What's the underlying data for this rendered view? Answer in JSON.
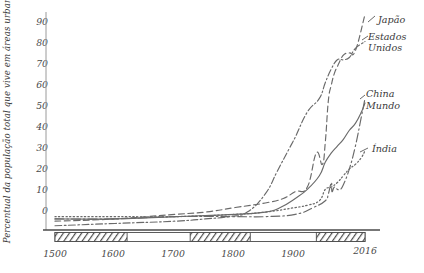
{
  "chart_data": {
    "type": "line",
    "title": "",
    "xlabel": "",
    "ylabel": "Percentual da população total que vive em áreas urbanas",
    "xlim": [
      1500,
      2016
    ],
    "ylim": [
      0,
      95
    ],
    "grid": false,
    "legend_position": "right-inline",
    "y_ticks": [
      0,
      10,
      20,
      30,
      40,
      50,
      60,
      70,
      80,
      90
    ],
    "x_ticks": [
      1500,
      1600,
      1700,
      1800,
      1900,
      2016
    ],
    "x_tick_labels": [
      "1500",
      "1600",
      "1700",
      "1800",
      "1900",
      "2016"
    ],
    "y_tick_labels": [
      "0",
      "10",
      "20",
      "30",
      "40",
      "50",
      "60",
      "70",
      "80",
      "90"
    ],
    "series": [
      {
        "name": "Japão",
        "style": "dashed",
        "x": [
          1500,
          1600,
          1700,
          1750,
          1800,
          1850,
          1880,
          1900,
          1920,
          1935,
          1945,
          1950,
          1955,
          1960,
          1965,
          1970,
          1980,
          1990,
          2000,
          2016
        ],
        "values": [
          3,
          4,
          6,
          7,
          9,
          11,
          13,
          16,
          18,
          33,
          28,
          38,
          56,
          63,
          68,
          71,
          76,
          77,
          78,
          94
        ]
      },
      {
        "name": "Estados Unidos",
        "style": "dash-dot",
        "x": [
          1500,
          1600,
          1700,
          1750,
          1790,
          1820,
          1850,
          1870,
          1890,
          1900,
          1920,
          1940,
          1950,
          1960,
          1970,
          1980,
          1990,
          2000,
          2016
        ],
        "values": [
          1,
          2,
          3,
          4,
          5,
          7,
          15,
          25,
          35,
          40,
          51,
          57,
          64,
          70,
          74,
          74,
          75,
          79,
          82
        ]
      },
      {
        "name": "China",
        "style": "dash-dot-long",
        "x": [
          1500,
          1600,
          1700,
          1800,
          1850,
          1900,
          1930,
          1950,
          1955,
          1960,
          1961,
          1965,
          1970,
          1975,
          1980,
          1990,
          2000,
          2010,
          2016
        ],
        "values": [
          4,
          4,
          5,
          5,
          5,
          6,
          9,
          12,
          15,
          20,
          16,
          18,
          17,
          17,
          19,
          26,
          36,
          49,
          57
        ]
      },
      {
        "name": "Mundo",
        "style": "solid",
        "x": [
          1500,
          1600,
          1700,
          1800,
          1850,
          1875,
          1900,
          1920,
          1940,
          1950,
          1960,
          1970,
          1980,
          1990,
          2000,
          2010,
          2016
        ],
        "values": [
          4,
          4,
          5,
          6,
          7,
          9,
          13,
          17,
          23,
          29,
          33,
          36,
          39,
          43,
          46,
          51,
          55
        ]
      },
      {
        "name": "Índia",
        "style": "dotted",
        "x": [
          1500,
          1600,
          1700,
          1800,
          1850,
          1900,
          1920,
          1940,
          1950,
          1960,
          1970,
          1980,
          1990,
          2000,
          2010,
          2016
        ],
        "values": [
          5,
          5,
          5,
          6,
          7,
          9,
          10,
          12,
          17,
          18,
          20,
          23,
          26,
          28,
          31,
          34
        ]
      }
    ],
    "annotations": [
      {
        "name": "Japão",
        "label": "Japão"
      },
      {
        "name": "Estados Unidos",
        "label": "Estados"
      },
      {
        "name": "Estados Unidos line 2",
        "label": "Unidos"
      },
      {
        "name": "China",
        "label": "China"
      },
      {
        "name": "Mundo",
        "label": "Mundo"
      },
      {
        "name": "Índia",
        "label": "Índia"
      }
    ],
    "timeline_bar": {
      "description": "hatched alternating era bar beneath x axis",
      "segments": [
        {
          "from": 1500,
          "to": 1620,
          "fill": "hatched"
        },
        {
          "from": 1620,
          "to": 1725,
          "fill": "white"
        },
        {
          "from": 1725,
          "to": 1825,
          "fill": "hatched"
        },
        {
          "from": 1825,
          "to": 1935,
          "fill": "white"
        },
        {
          "from": 1935,
          "to": 2016,
          "fill": "hatched"
        }
      ]
    },
    "colors": {
      "axis": "#8a8a8a",
      "text": "#3a3a3a",
      "line": "#6a6a6a",
      "hatch": "#555555"
    }
  },
  "labels": {
    "y_axis_title": "Percentual da população total que vive em áreas urbanas",
    "japao": "Japão",
    "estados": "Estados",
    "unidos": "Unidos",
    "china": "China",
    "mundo": "Mundo",
    "india": "Índia",
    "y_0": "0",
    "y_10": "10",
    "y_20": "20",
    "y_30": "30",
    "y_40": "40",
    "y_50": "50",
    "y_60": "60",
    "y_70": "70",
    "y_80": "80",
    "y_90": "90",
    "x_1500": "1500",
    "x_1600": "1600",
    "x_1700": "1700",
    "x_1800": "1800",
    "x_1900": "1900",
    "x_2016": "2016"
  }
}
